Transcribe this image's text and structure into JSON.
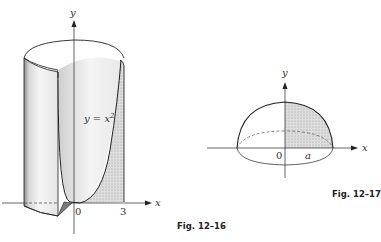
{
  "figures": [
    {
      "caption": "Fig. 12–16",
      "axes": {
        "x_label": "x",
        "y_label": "y",
        "origin_label": "0",
        "x_tick": "3"
      },
      "curve_label": "y = x²",
      "curve_label_base": "y = x",
      "curve_label_exp": "2",
      "description": "Solid of revolution: region under y = x^2 from 0 to 3 (shaded) rotated about the y-axis, forming a cut-away cylinder with a paraboloid inner surface"
    },
    {
      "caption": "Fig. 12–17",
      "axes": {
        "x_label": "x",
        "y_label": "y",
        "origin_label": "0",
        "x_tick": "a"
      },
      "description": "Hemisphere of radius a formed by rotating the shaded quarter-disk about the y-axis"
    }
  ],
  "colors": {
    "line": "#222222",
    "shade_dark": "#8a8a8a",
    "shade_light": "#d6d6d6",
    "surface": "#eeeeee"
  }
}
